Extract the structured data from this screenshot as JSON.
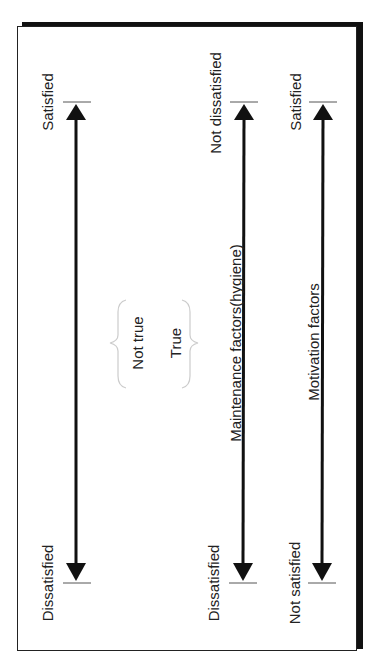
{
  "diagram": {
    "axes": [
      {
        "id": "traditional",
        "top_label": "Satisfied",
        "bottom_label": "Dissatisfied",
        "center_label": ""
      },
      {
        "id": "maintenance",
        "top_label": "Not dissatisfied",
        "bottom_label": "Dissatisfied",
        "center_label": "Maintenance factors(hygiene)"
      },
      {
        "id": "motivation",
        "top_label": "Satisfied",
        "bottom_label": "Not satisfied",
        "center_label": "Motivation factors"
      }
    ],
    "brace_group": {
      "left_label": "Not true",
      "right_label": "True"
    },
    "colors": {
      "line": "#111111",
      "text": "#222222",
      "brace": "#cccccc"
    }
  }
}
